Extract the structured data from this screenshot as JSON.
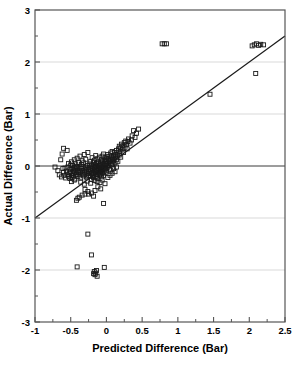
{
  "chart_data": {
    "type": "scatter",
    "title": "",
    "xlabel": "Predicted Difference (Bar)",
    "ylabel": "Actual Difference (Bar)",
    "xlim": [
      -1,
      2.5
    ],
    "ylim": [
      -3,
      3
    ],
    "xticks": [
      -1,
      -0.5,
      0,
      0.5,
      1,
      1.5,
      2,
      2.5
    ],
    "xtick_labels": [
      "-1",
      "-0.5",
      "0",
      "0.5",
      "1",
      "1.5",
      "2",
      "2.5"
    ],
    "xminor_ticks": [
      -0.75,
      -0.25,
      0.25,
      0.75,
      1.25,
      1.75,
      2.25
    ],
    "yticks": [
      -3,
      -2,
      -1,
      0,
      1,
      2,
      3
    ],
    "ytick_labels": [
      "-3",
      "-2",
      "-1",
      "0",
      "1",
      "2",
      "3"
    ],
    "yminor_ticks": [
      -2.5,
      -1.5,
      -0.5,
      0.5,
      1.5,
      2.5
    ],
    "grid": "horizontal-major-light",
    "gridlines_y": [
      2,
      1,
      -1,
      -2
    ],
    "zero_line_y": 0,
    "legend": null,
    "marker": "open-square",
    "marker_size_px": 4,
    "marker_color": "#1a1a1a",
    "reference_line": {
      "name": "identity-line",
      "equation": "y = x",
      "slope": 1,
      "intercept": 0,
      "x_start": -1,
      "y_start": -1,
      "x_end": 2.5,
      "y_end": 2.5,
      "color": "#1a1a1a"
    },
    "points": [
      [
        -0.72,
        -0.02
      ],
      [
        -0.68,
        -0.09
      ],
      [
        -0.66,
        -0.17
      ],
      [
        -0.64,
        0.12
      ],
      [
        -0.63,
        -0.21
      ],
      [
        -0.62,
        0.23
      ],
      [
        -0.61,
        -0.05
      ],
      [
        -0.6,
        -0.12
      ],
      [
        -0.6,
        0.34
      ],
      [
        -0.59,
        -0.18
      ],
      [
        -0.58,
        -0.04
      ],
      [
        -0.57,
        -0.23
      ],
      [
        -0.56,
        -0.1
      ],
      [
        -0.55,
        0.3
      ],
      [
        -0.55,
        -0.16
      ],
      [
        -0.54,
        -0.02
      ],
      [
        -0.53,
        -0.2
      ],
      [
        -0.53,
        0.05
      ],
      [
        -0.52,
        -0.13
      ],
      [
        -0.51,
        -0.07
      ],
      [
        -0.51,
        -0.24
      ],
      [
        -0.5,
        0.02
      ],
      [
        -0.5,
        -0.11
      ],
      [
        -0.49,
        -0.18
      ],
      [
        -0.49,
        0.08
      ],
      [
        -0.48,
        -0.05
      ],
      [
        -0.48,
        -0.22
      ],
      [
        -0.47,
        -0.14
      ],
      [
        -0.47,
        0.01
      ],
      [
        -0.46,
        -0.09
      ],
      [
        -0.46,
        -0.19
      ],
      [
        -0.45,
        -0.03
      ],
      [
        -0.45,
        0.12
      ],
      [
        -0.44,
        -0.12
      ],
      [
        -0.44,
        -0.25
      ],
      [
        -0.43,
        -0.06
      ],
      [
        -0.43,
        0.04
      ],
      [
        -0.42,
        -0.16
      ],
      [
        -0.42,
        -0.01
      ],
      [
        -0.41,
        -0.1
      ],
      [
        -0.41,
        0.15
      ],
      [
        -0.4,
        -0.2
      ],
      [
        -0.4,
        -0.04
      ],
      [
        -0.4,
        -0.62
      ],
      [
        -0.39,
        -0.13
      ],
      [
        -0.39,
        0.07
      ],
      [
        -0.38,
        -0.08
      ],
      [
        -0.38,
        -0.17
      ],
      [
        -0.37,
        -0.02
      ],
      [
        -0.37,
        0.19
      ],
      [
        -0.36,
        -0.11
      ],
      [
        -0.36,
        -0.23
      ],
      [
        -0.35,
        -0.05
      ],
      [
        -0.35,
        0.03
      ],
      [
        -0.34,
        -0.15
      ],
      [
        -0.34,
        0.1
      ],
      [
        -0.34,
        -0.56
      ],
      [
        -0.33,
        -0.09
      ],
      [
        -0.33,
        -0.01
      ],
      [
        -0.32,
        -0.19
      ],
      [
        -0.32,
        0.06
      ],
      [
        -0.31,
        -0.12
      ],
      [
        -0.31,
        0.22
      ],
      [
        -0.3,
        -0.06
      ],
      [
        -0.3,
        -0.16
      ],
      [
        -0.3,
        -0.45
      ],
      [
        -0.29,
        -0.02
      ],
      [
        -0.29,
        0.13
      ],
      [
        -0.28,
        -0.1
      ],
      [
        -0.28,
        -0.21
      ],
      [
        -0.27,
        -0.04
      ],
      [
        -0.27,
        0.01
      ],
      [
        -0.26,
        -0.14
      ],
      [
        -0.26,
        0.26
      ],
      [
        -0.25,
        -0.07
      ],
      [
        -0.25,
        -0.18
      ],
      [
        -0.25,
        -0.54
      ],
      [
        -0.24,
        0.04
      ],
      [
        -0.24,
        -0.11
      ],
      [
        -0.23,
        -0.02
      ],
      [
        -0.23,
        -0.2
      ],
      [
        -0.22,
        0.09
      ],
      [
        -0.22,
        -0.08
      ],
      [
        -0.21,
        -0.15
      ],
      [
        -0.21,
        0.02
      ],
      [
        -0.21,
        -0.26
      ],
      [
        -0.2,
        -0.05
      ],
      [
        -0.2,
        0.16
      ],
      [
        -0.2,
        -0.12
      ],
      [
        -0.19,
        -0.19
      ],
      [
        -0.19,
        0.0
      ],
      [
        -0.19,
        -0.08
      ],
      [
        -0.18,
        0.07
      ],
      [
        -0.18,
        -0.14
      ],
      [
        -0.18,
        -0.22
      ],
      [
        -0.17,
        -0.03
      ],
      [
        -0.17,
        0.11
      ],
      [
        -0.17,
        -0.1
      ],
      [
        -0.16,
        -0.17
      ],
      [
        -0.16,
        0.02
      ],
      [
        -0.16,
        -0.06
      ],
      [
        -0.15,
        0.2
      ],
      [
        -0.15,
        -0.12
      ],
      [
        -0.15,
        -0.01
      ],
      [
        -0.14,
        -0.08
      ],
      [
        -0.14,
        0.05
      ],
      [
        -0.14,
        -0.2
      ],
      [
        -0.13,
        -0.04
      ],
      [
        -0.13,
        0.14
      ],
      [
        -0.13,
        -0.15
      ],
      [
        -0.12,
        -0.09
      ],
      [
        -0.12,
        0.01
      ],
      [
        -0.12,
        -0.24
      ],
      [
        -0.11,
        -0.05
      ],
      [
        -0.11,
        0.08
      ],
      [
        -0.11,
        -0.13
      ],
      [
        -0.1,
        -0.02
      ],
      [
        -0.1,
        -0.18
      ],
      [
        -0.1,
        0.17
      ],
      [
        -0.09,
        -0.07
      ],
      [
        -0.09,
        0.03
      ],
      [
        -0.09,
        -0.11
      ],
      [
        -0.08,
        -0.16
      ],
      [
        -0.08,
        0.06
      ],
      [
        -0.08,
        -0.03
      ],
      [
        -0.07,
        0.12
      ],
      [
        -0.07,
        -0.09
      ],
      [
        -0.07,
        -0.21
      ],
      [
        -0.06,
        0.0
      ],
      [
        -0.06,
        -0.14
      ],
      [
        -0.06,
        0.19
      ],
      [
        -0.05,
        -0.05
      ],
      [
        -0.05,
        0.08
      ],
      [
        -0.05,
        -0.12
      ],
      [
        -0.04,
        0.02
      ],
      [
        -0.04,
        -0.18
      ],
      [
        -0.04,
        0.23
      ],
      [
        -0.03,
        -0.07
      ],
      [
        -0.03,
        0.11
      ],
      [
        -0.03,
        -0.02
      ],
      [
        -0.02,
        0.05
      ],
      [
        -0.02,
        -0.13
      ],
      [
        -0.02,
        0.16
      ],
      [
        -0.01,
        -0.05
      ],
      [
        -0.01,
        0.09
      ],
      [
        -0.01,
        0.0
      ],
      [
        0.0,
        0.13
      ],
      [
        0.0,
        -0.09
      ],
      [
        0.0,
        0.04
      ],
      [
        0.01,
        0.18
      ],
      [
        0.01,
        -0.03
      ],
      [
        0.02,
        0.08
      ],
      [
        0.02,
        0.22
      ],
      [
        0.03,
        0.01
      ],
      [
        0.03,
        0.14
      ],
      [
        0.04,
        -0.06
      ],
      [
        0.04,
        0.1
      ],
      [
        0.05,
        0.19
      ],
      [
        0.05,
        0.05
      ],
      [
        0.06,
        0.25
      ],
      [
        0.06,
        0.12
      ],
      [
        0.07,
        0.02
      ],
      [
        0.07,
        0.17
      ],
      [
        0.08,
        0.08
      ],
      [
        0.08,
        0.28
      ],
      [
        0.09,
        0.14
      ],
      [
        0.09,
        0.04
      ],
      [
        0.1,
        0.2
      ],
      [
        0.1,
        0.1
      ],
      [
        0.11,
        0.26
      ],
      [
        0.12,
        0.16
      ],
      [
        0.12,
        0.06
      ],
      [
        0.13,
        0.22
      ],
      [
        0.14,
        0.12
      ],
      [
        0.14,
        0.3
      ],
      [
        0.15,
        0.19
      ],
      [
        0.16,
        0.25
      ],
      [
        0.16,
        0.09
      ],
      [
        0.17,
        0.33
      ],
      [
        0.18,
        0.21
      ],
      [
        0.18,
        0.38
      ],
      [
        0.19,
        0.28
      ],
      [
        0.2,
        0.35
      ],
      [
        0.2,
        0.17
      ],
      [
        0.21,
        0.42
      ],
      [
        0.22,
        0.31
      ],
      [
        0.23,
        0.39
      ],
      [
        0.24,
        0.26
      ],
      [
        0.25,
        0.45
      ],
      [
        0.26,
        0.36
      ],
      [
        0.27,
        0.48
      ],
      [
        0.28,
        0.41
      ],
      [
        0.29,
        0.33
      ],
      [
        0.3,
        0.47
      ],
      [
        0.31,
        0.52
      ],
      [
        0.33,
        0.44
      ],
      [
        0.35,
        0.5
      ],
      [
        0.36,
        0.58
      ],
      [
        0.38,
        0.68
      ],
      [
        0.4,
        0.55
      ],
      [
        0.42,
        0.63
      ],
      [
        0.45,
        0.71
      ],
      [
        0.05,
        -0.18
      ],
      [
        0.06,
        -0.08
      ],
      [
        0.08,
        -0.14
      ],
      [
        0.1,
        -0.05
      ],
      [
        0.12,
        -0.11
      ],
      [
        0.14,
        -0.02
      ],
      [
        0.02,
        -0.22
      ],
      [
        -0.09,
        -0.32
      ],
      [
        -0.13,
        -0.3
      ],
      [
        -0.17,
        -0.28
      ],
      [
        -0.22,
        -0.33
      ],
      [
        -0.27,
        -0.29
      ],
      [
        -0.31,
        -0.35
      ],
      [
        -0.36,
        -0.31
      ],
      [
        -0.06,
        -0.27
      ],
      [
        -0.02,
        -0.34
      ],
      [
        -0.45,
        -0.27
      ],
      [
        -0.49,
        -0.3
      ],
      [
        -0.12,
        -0.4
      ],
      [
        -0.16,
        -0.47
      ],
      [
        -0.08,
        -0.44
      ],
      [
        -0.21,
        -0.52
      ],
      [
        -0.04,
        -0.72
      ],
      [
        -0.18,
        -0.58
      ],
      [
        -0.26,
        -0.49
      ],
      [
        -0.3,
        -0.54
      ],
      [
        -0.42,
        -0.66
      ],
      [
        -0.38,
        -0.6
      ],
      [
        0.78,
        2.35
      ],
      [
        0.81,
        2.35
      ],
      [
        0.84,
        2.35
      ],
      [
        1.45,
        1.38
      ],
      [
        2.09,
        1.78
      ],
      [
        2.04,
        2.31
      ],
      [
        2.07,
        2.33
      ],
      [
        2.1,
        2.35
      ],
      [
        2.13,
        2.32
      ],
      [
        2.16,
        2.34
      ],
      [
        2.2,
        2.33
      ],
      [
        -0.26,
        -1.31
      ],
      [
        -0.21,
        -1.71
      ],
      [
        -0.41,
        -1.94
      ],
      [
        -0.03,
        -1.95
      ],
      [
        -0.17,
        -2.03
      ],
      [
        -0.15,
        -2.06
      ],
      [
        -0.16,
        -2.09
      ],
      [
        -0.13,
        -2.12
      ],
      [
        -0.18,
        -2.07
      ],
      [
        -0.14,
        -2.01
      ]
    ]
  },
  "accent_color": "#1a1a1a",
  "grid_color": "#d9d9d9",
  "axis_color": "#555555",
  "background_color": "#ffffff"
}
